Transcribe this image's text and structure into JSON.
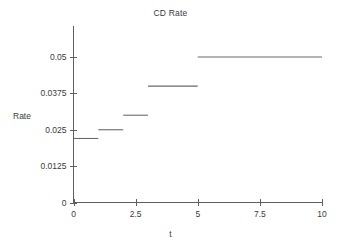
{
  "chart_data": {
    "type": "line",
    "subtype": "step-post",
    "title": "CD Rate",
    "xlabel": "t",
    "ylabel": "Rate",
    "xlim": [
      0,
      10
    ],
    "ylim": [
      0,
      0.05625
    ],
    "grid": false,
    "legend": null,
    "xticks": [
      0,
      2.5,
      5,
      7.5,
      10
    ],
    "xtick_labels": [
      "0",
      "2.5",
      "5",
      "7.5",
      "10"
    ],
    "yticks": [
      0,
      0.0125,
      0.025,
      0.0375,
      0.05
    ],
    "ytick_labels": [
      "0",
      "0.0125",
      "0.025",
      "0.0375",
      "0.05"
    ],
    "series": [
      {
        "name": "CD Rate",
        "color": "#6a6a6a",
        "steps": [
          {
            "x_start": 0,
            "x_end": 1,
            "y": 0.022
          },
          {
            "x_start": 1,
            "x_end": 2,
            "y": 0.025
          },
          {
            "x_start": 2,
            "x_end": 3,
            "y": 0.03
          },
          {
            "x_start": 3,
            "x_end": 5,
            "y": 0.04
          },
          {
            "x_start": 5,
            "x_end": 10,
            "y": 0.05
          }
        ]
      }
    ]
  },
  "axes": {
    "title": "CD Rate",
    "ylabel": "Rate",
    "xlabel": "t"
  },
  "colors": {
    "axis": "#5e5e5e",
    "data": "#6a6a6a",
    "text": "#3a3a3a",
    "background": "#ffffff"
  }
}
